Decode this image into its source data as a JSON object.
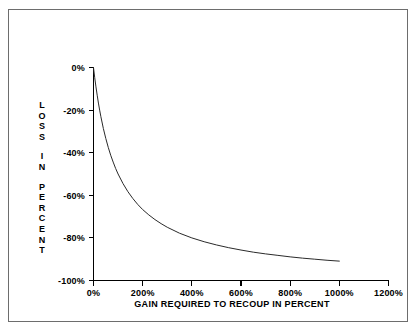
{
  "figure": {
    "border_color": "#6d6d6d",
    "background": "#ffffff"
  },
  "chart_data": {
    "type": "line",
    "title": "",
    "subtitle": "",
    "xlabel": "GAIN REQUIRED TO RECOUP IN PERCENT",
    "ylabel": "LOSS IN PERCENT",
    "ylabel_lines": [
      "LOSS",
      "IN",
      "PERCENT"
    ],
    "xlim": [
      0,
      1200
    ],
    "ylim": [
      -100,
      0
    ],
    "grid": false,
    "legend": null,
    "axis_color": "#000000",
    "line_color": "#2a2a2a",
    "x_ticks": [
      0,
      200,
      400,
      600,
      800,
      1000,
      1200
    ],
    "x_tick_labels": [
      "0%",
      "200%",
      "400%",
      "600%",
      "800%",
      "1000%",
      "1200%"
    ],
    "y_ticks": [
      0,
      -20,
      -40,
      -60,
      -80,
      -100
    ],
    "y_tick_labels": [
      "0%",
      "-20%",
      "-40%",
      "-60%",
      "-80%",
      "-100%"
    ],
    "relation": "loss = -gain / (1 + gain)",
    "x": [
      0,
      5,
      10,
      15,
      20,
      25,
      30,
      40,
      50,
      60,
      70,
      80,
      90,
      100,
      120,
      140,
      160,
      180,
      200,
      225,
      250,
      275,
      300,
      350,
      400,
      450,
      500,
      550,
      600,
      650,
      700,
      750,
      800,
      850,
      900,
      950,
      1000
    ],
    "values": [
      0,
      -4.8,
      -9.1,
      -13,
      -16.7,
      -20,
      -23.1,
      -28.6,
      -33.3,
      -37.5,
      -41.2,
      -44.4,
      -47.4,
      -50,
      -54.5,
      -58.3,
      -61.5,
      -64.3,
      -66.7,
      -69.2,
      -71.4,
      -73.3,
      -75,
      -77.8,
      -80,
      -81.8,
      -83.3,
      -84.6,
      -85.7,
      -86.7,
      -87.5,
      -88.2,
      -88.9,
      -89.5,
      -90,
      -90.5,
      -90.9
    ],
    "series_name": "Loss required to recoup",
    "curve_x_start": 0,
    "curve_x_end": 1000
  }
}
